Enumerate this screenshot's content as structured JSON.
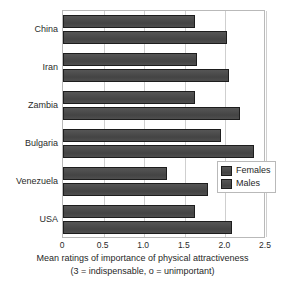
{
  "chart_data": {
    "type": "bar",
    "orientation": "horizontal",
    "title": "",
    "xlabel": "Mean ratings of importance of physical attractiveness",
    "xlabel_subtitle": "(3 = indispensable, o = unimportant)",
    "ylabel": "",
    "categories": [
      "China",
      "Iran",
      "Zambia",
      "Bulgaria",
      "Venezuela",
      "USA"
    ],
    "series": [
      {
        "name": "Females",
        "values": [
          1.62,
          1.65,
          1.63,
          1.95,
          1.28,
          1.62
        ]
      },
      {
        "name": "Males",
        "values": [
          2.02,
          2.05,
          2.18,
          2.35,
          1.78,
          2.08
        ]
      }
    ],
    "xlim": [
      0,
      2.5
    ],
    "xticks": [
      0,
      0.5,
      1.0,
      1.5,
      2.0,
      2.5
    ],
    "xtick_labels": [
      "0",
      "0.5",
      "1.0",
      "1.5",
      "2.0",
      "2.5"
    ],
    "grid": true,
    "grid_axis": "x",
    "legend_position": "center-right",
    "colors": {
      "bar_fill": "#4a4a4a",
      "bar_border": "#1d1d1d",
      "gridline": "#cfcfcf",
      "frame": "#b9b9b9",
      "text": "#1f1f1f",
      "background": "#ffffff"
    }
  }
}
